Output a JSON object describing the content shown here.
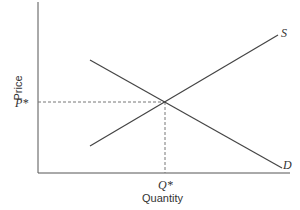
{
  "diagram": {
    "type": "supply-demand",
    "axes": {
      "x_label": "Quantity",
      "y_label": "Price"
    },
    "curves": [
      {
        "name": "S",
        "label": "S",
        "kind": "supply",
        "from": [
          90,
          146
        ],
        "to": [
          278,
          35
        ]
      },
      {
        "name": "D",
        "label": "D",
        "kind": "demand",
        "from": [
          90,
          60
        ],
        "to": [
          282,
          168
        ]
      }
    ],
    "equilibrium": {
      "price_label": "P*",
      "quantity_label": "Q*",
      "point": [
        165,
        102
      ]
    },
    "colors": {
      "axis": "#555555",
      "curve": "#444444",
      "dashed": "#777777",
      "text": "#333333"
    }
  }
}
